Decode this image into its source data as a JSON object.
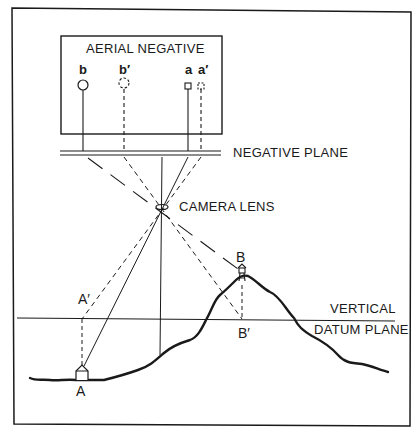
{
  "diagram": {
    "type": "relief-displacement-diagram",
    "colors": {
      "ink": "#1a1a1a",
      "background": "#ffffff"
    },
    "labels": {
      "aerial_negative": "AERIAL NEGATIVE",
      "negative_plane": "NEGATIVE PLANE",
      "camera_lens": "CAMERA LENS",
      "vertical_datum_line1": "VERTICAL",
      "vertical_datum_line2": "DATUM PLANE"
    },
    "negative_points": {
      "b": "b",
      "b_prime": "b′",
      "a": "a",
      "a_prime": "a′"
    },
    "ground_points": {
      "A": "A",
      "A_prime": "A′",
      "B": "B",
      "B_prime": "B′"
    },
    "objects": {
      "A": "house-icon",
      "B": "tower-icon"
    }
  }
}
